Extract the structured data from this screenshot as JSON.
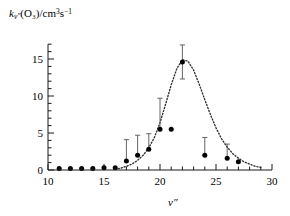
{
  "chart_data": {
    "type": "scatter",
    "title": "",
    "subtitle": "",
    "xlabel": "v″",
    "ylabel": "k_v″(O₃)/cm³s⁻¹",
    "ylabel_parts": {
      "symbol": "k",
      "symbol_sub": "v″",
      "species": "(O₃)",
      "slash": "/",
      "units": "cm³s⁻¹",
      "units_base1": "cm",
      "units_exp1": "3",
      "units_base2": "s",
      "units_exp2": "−1"
    },
    "xlim": [
      10,
      30
    ],
    "ylim": [
      0,
      17
    ],
    "xticks": [
      10,
      15,
      20,
      25,
      30
    ],
    "xtick_labels": [
      "10",
      "15",
      "20",
      "25",
      "30"
    ],
    "x_minor_step": 1,
    "yticks": [
      0,
      5,
      10,
      15
    ],
    "ytick_labels": [
      "0",
      "5",
      "10",
      "15"
    ],
    "y_minor_step": 1,
    "grid": false,
    "legend": "none",
    "marker": "filled-circle",
    "marker_color": "#000000",
    "errorbar_color": "#555555",
    "curve_style": "dotted",
    "curve_color": "#333333",
    "series": [
      {
        "name": "measured rate coefficients",
        "x": [
          11,
          12,
          13,
          14,
          15,
          16,
          17,
          18,
          19,
          20,
          21,
          22,
          24,
          26,
          27
        ],
        "values": [
          0.2,
          0.2,
          0.2,
          0.2,
          0.3,
          0.3,
          1.2,
          2.0,
          2.8,
          5.5,
          5.5,
          14.6,
          2.0,
          1.6,
          1.1
        ],
        "err_up": [
          0.0,
          0.0,
          0.0,
          0.0,
          0.0,
          0.0,
          2.9,
          2.7,
          2.1,
          4.2,
          0.0,
          2.3,
          2.4,
          1.9,
          0.0
        ],
        "err_down": [
          0.0,
          0.0,
          0.0,
          0.0,
          0.0,
          0.0,
          0.2,
          0.2,
          0.2,
          0.3,
          0.0,
          2.3,
          0.2,
          0.2,
          0.0
        ]
      }
    ],
    "fit_curve": {
      "name": "fitted distribution",
      "x": [
        16.0,
        16.5,
        17.0,
        17.5,
        18.0,
        18.5,
        19.0,
        19.5,
        20.0,
        20.5,
        21.0,
        21.5,
        22.0,
        22.5,
        23.0,
        23.5,
        24.0,
        24.5,
        25.0,
        25.5,
        26.0,
        26.5,
        27.0,
        27.5,
        28.0,
        28.5,
        29.0
      ],
      "values": [
        0.1,
        0.25,
        0.5,
        0.8,
        1.3,
        2.0,
        3.0,
        4.4,
        6.4,
        8.9,
        11.5,
        13.7,
        14.9,
        14.7,
        13.5,
        11.6,
        9.5,
        7.5,
        5.7,
        4.2,
        3.1,
        2.2,
        1.6,
        1.1,
        0.8,
        0.5,
        0.35
      ]
    }
  }
}
